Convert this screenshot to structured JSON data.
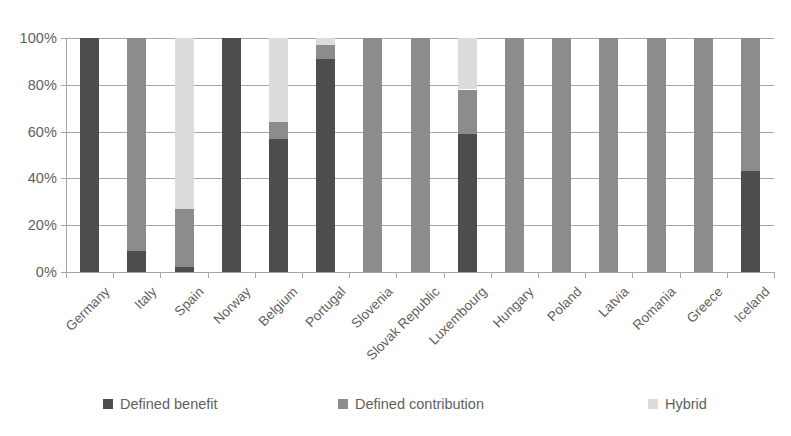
{
  "chart_data": {
    "type": "bar",
    "subtype": "stacked-bar-100-percent",
    "title": "",
    "xlabel": "",
    "ylabel": "",
    "ylim": [
      0,
      100
    ],
    "ytick_labels": [
      "100%",
      "80%",
      "60%",
      "40%",
      "20%",
      "0%"
    ],
    "ytick_values": [
      100,
      80,
      60,
      40,
      20,
      0
    ],
    "grid": true,
    "grid_axis": "y",
    "legend_position": "bottom",
    "categories": [
      "Germany",
      "Italy",
      "Spain",
      "Norway",
      "Belgium",
      "Portugal",
      "Slovenia",
      "Slovak Republic",
      "Luxembourg",
      "Hungary",
      "Poland",
      "Latvia",
      "Romania",
      "Greece",
      "Iceland"
    ],
    "series": [
      {
        "name": "Defined benefit",
        "color": "#4d4d4d",
        "values": [
          100,
          9,
          2,
          100,
          57,
          91,
          0,
          0,
          59,
          0,
          0,
          0,
          0,
          0,
          43
        ]
      },
      {
        "name": "Defined contribution",
        "color": "#8c8c8c",
        "values": [
          0,
          91,
          25,
          0,
          7,
          6,
          100,
          100,
          19,
          100,
          100,
          100,
          100,
          100,
          57
        ]
      },
      {
        "name": "Hybrid",
        "color": "#dcdcdc",
        "values": [
          0,
          0,
          73,
          0,
          36,
          3,
          0,
          0,
          22,
          0,
          0,
          0,
          0,
          0,
          0
        ]
      }
    ]
  },
  "legend": {
    "items": [
      {
        "label": "Defined benefit",
        "color": "#4d4d4d"
      },
      {
        "label": "Defined contribution",
        "color": "#8c8c8c"
      },
      {
        "label": "Hybrid",
        "color": "#dcdcdc"
      }
    ]
  },
  "colors": {
    "axis": "#a6a6a6",
    "grid": "#a6a6a6",
    "text": "#5f5f5f",
    "background": "#ffffff"
  }
}
